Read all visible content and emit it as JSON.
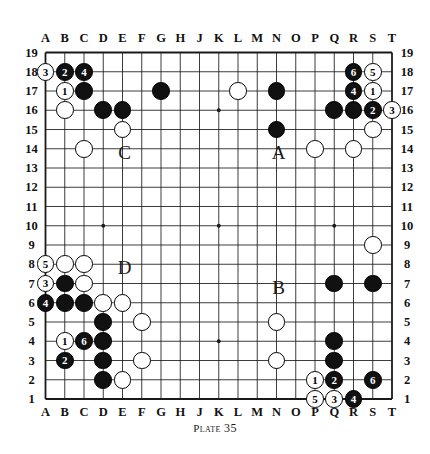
{
  "figure": {
    "kind": "go-board-diagram",
    "board_size": 19,
    "caption_word": "Plate",
    "caption_number": "35"
  },
  "axes": {
    "columns": [
      "A",
      "B",
      "C",
      "D",
      "E",
      "F",
      "G",
      "H",
      "J",
      "K",
      "L",
      "M",
      "N",
      "O",
      "P",
      "Q",
      "R",
      "S",
      "T"
    ],
    "rows": [
      "19",
      "18",
      "17",
      "16",
      "15",
      "14",
      "13",
      "12",
      "11",
      "10",
      "9",
      "8",
      "7",
      "6",
      "5",
      "4",
      "3",
      "2",
      "1"
    ]
  },
  "colors": {
    "black_stone": "#111111",
    "white_stone": "#ffffff",
    "line": "#1a1a1a",
    "background": "#ffffff"
  },
  "annotations": [
    {
      "label": "C",
      "col": "E",
      "row": 14
    },
    {
      "label": "A",
      "col": "N",
      "row": 14
    },
    {
      "label": "D",
      "col": "E",
      "row": 8
    },
    {
      "label": "B",
      "col": "N",
      "row": 7
    }
  ],
  "star_points": [
    {
      "col": "D",
      "row": 16
    },
    {
      "col": "K",
      "row": 16
    },
    {
      "col": "Q",
      "row": 16
    },
    {
      "col": "D",
      "row": 10
    },
    {
      "col": "K",
      "row": 10
    },
    {
      "col": "Q",
      "row": 10
    },
    {
      "col": "D",
      "row": 4
    },
    {
      "col": "K",
      "row": 4
    },
    {
      "col": "Q",
      "row": 4
    }
  ],
  "stones": [
    {
      "col": "A",
      "row": 18,
      "color": "white",
      "number": "3"
    },
    {
      "col": "B",
      "row": 18,
      "color": "black",
      "number": "2"
    },
    {
      "col": "C",
      "row": 18,
      "color": "black",
      "number": "4"
    },
    {
      "col": "B",
      "row": 17,
      "color": "white",
      "number": "1"
    },
    {
      "col": "C",
      "row": 17,
      "color": "black",
      "number": ""
    },
    {
      "col": "B",
      "row": 16,
      "color": "white",
      "number": ""
    },
    {
      "col": "D",
      "row": 16,
      "color": "black",
      "number": ""
    },
    {
      "col": "E",
      "row": 16,
      "color": "black",
      "number": ""
    },
    {
      "col": "E",
      "row": 15,
      "color": "white",
      "number": ""
    },
    {
      "col": "C",
      "row": 14,
      "color": "white",
      "number": ""
    },
    {
      "col": "G",
      "row": 17,
      "color": "black",
      "number": ""
    },
    {
      "col": "L",
      "row": 17,
      "color": "white",
      "number": ""
    },
    {
      "col": "N",
      "row": 17,
      "color": "black",
      "number": ""
    },
    {
      "col": "N",
      "row": 15,
      "color": "black",
      "number": ""
    },
    {
      "col": "P",
      "row": 14,
      "color": "white",
      "number": ""
    },
    {
      "col": "R",
      "row": 14,
      "color": "white",
      "number": ""
    },
    {
      "col": "R",
      "row": 18,
      "color": "black",
      "number": "6"
    },
    {
      "col": "S",
      "row": 18,
      "color": "white",
      "number": "5"
    },
    {
      "col": "R",
      "row": 17,
      "color": "black",
      "number": "4"
    },
    {
      "col": "S",
      "row": 17,
      "color": "white",
      "number": "1"
    },
    {
      "col": "Q",
      "row": 16,
      "color": "black",
      "number": ""
    },
    {
      "col": "R",
      "row": 16,
      "color": "black",
      "number": ""
    },
    {
      "col": "S",
      "row": 16,
      "color": "black",
      "number": "2"
    },
    {
      "col": "T",
      "row": 16,
      "color": "white",
      "number": "3"
    },
    {
      "col": "S",
      "row": 15,
      "color": "white",
      "number": ""
    },
    {
      "col": "S",
      "row": 9,
      "color": "white",
      "number": ""
    },
    {
      "col": "Q",
      "row": 7,
      "color": "black",
      "number": ""
    },
    {
      "col": "S",
      "row": 7,
      "color": "black",
      "number": ""
    },
    {
      "col": "A",
      "row": 8,
      "color": "white",
      "number": "5"
    },
    {
      "col": "B",
      "row": 8,
      "color": "white",
      "number": ""
    },
    {
      "col": "C",
      "row": 8,
      "color": "white",
      "number": ""
    },
    {
      "col": "A",
      "row": 7,
      "color": "white",
      "number": "3"
    },
    {
      "col": "B",
      "row": 7,
      "color": "black",
      "number": ""
    },
    {
      "col": "C",
      "row": 7,
      "color": "white",
      "number": ""
    },
    {
      "col": "A",
      "row": 6,
      "color": "black",
      "number": "4"
    },
    {
      "col": "B",
      "row": 6,
      "color": "black",
      "number": ""
    },
    {
      "col": "C",
      "row": 6,
      "color": "black",
      "number": ""
    },
    {
      "col": "D",
      "row": 6,
      "color": "white",
      "number": ""
    },
    {
      "col": "E",
      "row": 6,
      "color": "white",
      "number": ""
    },
    {
      "col": "D",
      "row": 5,
      "color": "black",
      "number": ""
    },
    {
      "col": "F",
      "row": 5,
      "color": "white",
      "number": ""
    },
    {
      "col": "B",
      "row": 4,
      "color": "white",
      "number": "1"
    },
    {
      "col": "C",
      "row": 4,
      "color": "black",
      "number": "6"
    },
    {
      "col": "D",
      "row": 4,
      "color": "black",
      "number": ""
    },
    {
      "col": "B",
      "row": 3,
      "color": "black",
      "number": "2"
    },
    {
      "col": "D",
      "row": 3,
      "color": "black",
      "number": ""
    },
    {
      "col": "F",
      "row": 3,
      "color": "white",
      "number": ""
    },
    {
      "col": "D",
      "row": 2,
      "color": "black",
      "number": ""
    },
    {
      "col": "E",
      "row": 2,
      "color": "white",
      "number": ""
    },
    {
      "col": "N",
      "row": 5,
      "color": "white",
      "number": ""
    },
    {
      "col": "N",
      "row": 3,
      "color": "white",
      "number": ""
    },
    {
      "col": "Q",
      "row": 4,
      "color": "black",
      "number": ""
    },
    {
      "col": "Q",
      "row": 3,
      "color": "black",
      "number": ""
    },
    {
      "col": "P",
      "row": 2,
      "color": "white",
      "number": "1"
    },
    {
      "col": "Q",
      "row": 2,
      "color": "black",
      "number": "2"
    },
    {
      "col": "S",
      "row": 2,
      "color": "black",
      "number": "6"
    },
    {
      "col": "P",
      "row": 1,
      "color": "white",
      "number": "5"
    },
    {
      "col": "Q",
      "row": 1,
      "color": "white",
      "number": "3"
    },
    {
      "col": "R",
      "row": 1,
      "color": "black",
      "number": "4"
    }
  ]
}
